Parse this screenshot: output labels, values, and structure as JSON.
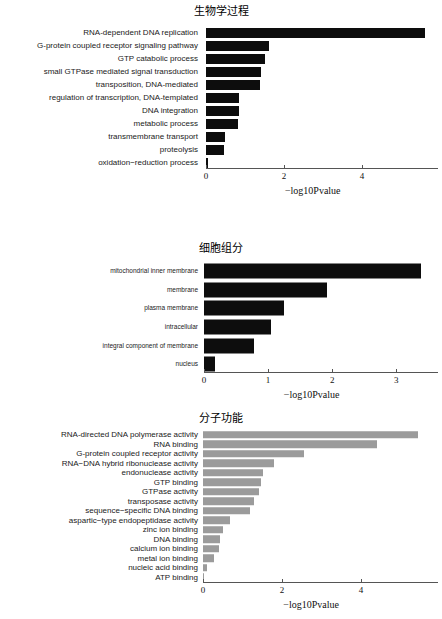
{
  "figure": {
    "background": "#ffffff",
    "bar_color_dark": "#0d0d0d",
    "bar_color_gray": "#9b9b9b",
    "axis_color": "#555555"
  },
  "chart_data": [
    {
      "id": "biological-process",
      "type": "bar",
      "orientation": "horizontal",
      "title": "生物学过程",
      "xlabel": "−log10Pvalue",
      "ylabel": "",
      "xlim": [
        0,
        5.95
      ],
      "xticks": [
        0,
        2,
        4
      ],
      "xticklabels": [
        "0",
        "2",
        "4"
      ],
      "grid": false,
      "legend": null,
      "bar_color": "#0d0d0d",
      "categories": [
        "RNA-dependent DNA replication",
        "G-protein coupled receptor signaling pathway",
        "GTP catabolic process",
        "small GTPase mediated signal transduction",
        "transposition, DNA-mediated",
        "regulation of transcription, DNA-templated",
        "DNA integration",
        "metabolic process",
        "transmembrane transport",
        "proteolysis",
        "oxidation−reduction process"
      ],
      "values": [
        5.62,
        1.62,
        1.52,
        1.4,
        1.38,
        0.85,
        0.85,
        0.83,
        0.48,
        0.47,
        0.04
      ]
    },
    {
      "id": "cellular-component",
      "type": "bar",
      "orientation": "horizontal",
      "title": "细胞组分",
      "xlabel": "−log10Pvalue",
      "ylabel": "",
      "xlim": [
        0,
        3.65
      ],
      "xticks": [
        0,
        1,
        2,
        3
      ],
      "xticklabels": [
        "0",
        "1",
        "2",
        "3"
      ],
      "grid": false,
      "legend": null,
      "bar_color": "#0d0d0d",
      "categories": [
        "mitochondrial inner membrane",
        "membrane",
        "plasma membrane",
        "intracellular",
        "integral component of membrane",
        "nucleus"
      ],
      "values": [
        3.38,
        1.92,
        1.25,
        1.05,
        0.78,
        0.17
      ]
    },
    {
      "id": "molecular-function",
      "type": "bar",
      "orientation": "horizontal",
      "title": "分子功能",
      "xlabel": "−log10Pvalue",
      "ylabel": "",
      "xlim": [
        0,
        5.95
      ],
      "xticks": [
        0,
        2,
        4
      ],
      "xticklabels": [
        "0",
        "2",
        "4"
      ],
      "grid": false,
      "legend": null,
      "bar_color": "#9b9b9b",
      "categories": [
        "RNA-directed DNA polymerase activity",
        "RNA binding",
        "G-protein coupled receptor activity",
        "RNA−DNA hybrid ribonuclease activity",
        "endonuclease activity",
        "GTP binding",
        "GTPase activity",
        "transposase activity",
        "sequence−specific DNA binding",
        "aspartic−type endopeptidase activity",
        "zinc ion binding",
        "DNA binding",
        "calcium ion binding",
        "metal ion binding",
        "nucleic acid binding",
        "ATP binding"
      ],
      "values": [
        5.45,
        4.4,
        2.55,
        1.8,
        1.53,
        1.48,
        1.42,
        1.3,
        1.18,
        0.68,
        0.5,
        0.42,
        0.4,
        0.28,
        0.1,
        0.02
      ]
    }
  ]
}
